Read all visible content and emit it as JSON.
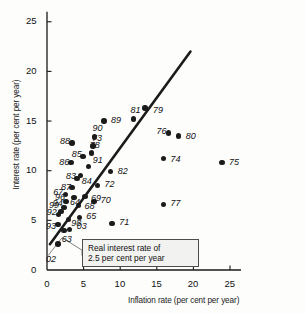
{
  "chart_data": {
    "type": "scatter",
    "title": "",
    "xlabel": "Inflation rate (per cent per year)",
    "ylabel": "Interest rate (per cent per year)",
    "xlim": [
      0,
      26.5
    ],
    "ylim": [
      0,
      26
    ],
    "xticks": [
      0,
      5,
      10,
      15,
      20,
      25
    ],
    "yticks": [
      0,
      5,
      10,
      15,
      20,
      25
    ],
    "grid": false,
    "legend": null,
    "annotations": [
      {
        "name": "real-interest-rate-note",
        "line1": "Real interest rate of",
        "line2": "2.5 per cent per year"
      }
    ],
    "trend_line": {
      "name": "real-interest-rate-line",
      "x0": 0.4,
      "y0": 2.6,
      "x1": 19.6,
      "y1": 22.0
    },
    "point_label_key": "year (two digits)",
    "points": [
      {
        "label": "02",
        "x": 1.5,
        "y": 2.6,
        "lx": -12,
        "ly": 16
      },
      {
        "label": "63",
        "x": 2.3,
        "y": 4.0,
        "lx": -2,
        "ly": 10
      },
      {
        "label": "03",
        "x": 3.1,
        "y": 4.1,
        "lx": 7,
        "ly": -2
      },
      {
        "label": "93",
        "x": 1.5,
        "y": 4.6,
        "lx": -12,
        "ly": 3
      },
      {
        "label": "98",
        "x": 2.9,
        "y": 5.1,
        "lx": 3,
        "ly": 5
      },
      {
        "label": "65",
        "x": 4.4,
        "y": 5.3,
        "lx": 7,
        "ly": 0
      },
      {
        "label": "92",
        "x": 1.6,
        "y": 5.6,
        "lx": -12,
        "ly": -1
      },
      {
        "label": "99",
        "x": 1.9,
        "y": 5.9,
        "lx": -12,
        "ly": -5
      },
      {
        "label": "94",
        "x": 2.3,
        "y": 6.3,
        "lx": -11,
        "ly": -3
      },
      {
        "label": "96",
        "x": 2.6,
        "y": 6.9,
        "lx": -11,
        "ly": -3
      },
      {
        "label": "68",
        "x": 4.3,
        "y": 6.5,
        "lx": 6,
        "ly": 2
      },
      {
        "label": "70",
        "x": 6.4,
        "y": 6.9,
        "lx": 7,
        "ly": 0
      },
      {
        "label": "77",
        "x": 15.9,
        "y": 6.6,
        "lx": 7,
        "ly": 0
      },
      {
        "label": "64",
        "x": 3.7,
        "y": 7.3,
        "lx": -4,
        "ly": 5
      },
      {
        "label": "67",
        "x": 2.5,
        "y": 7.6,
        "lx": -12,
        "ly": -2
      },
      {
        "label": "69",
        "x": 5.2,
        "y": 7.4,
        "lx": 6,
        "ly": 2
      },
      {
        "label": "87",
        "x": 3.4,
        "y": 8.3,
        "lx": -11,
        "ly": 0
      },
      {
        "label": "72",
        "x": 6.9,
        "y": 8.5,
        "lx": 7,
        "ly": -1
      },
      {
        "label": "83",
        "x": 4.1,
        "y": 9.2,
        "lx": -11,
        "ly": -2
      },
      {
        "label": "84",
        "x": 4.6,
        "y": 9.5,
        "lx": 1,
        "ly": 6
      },
      {
        "label": "71",
        "x": 8.9,
        "y": 4.7,
        "lx": 7,
        "ly": 0
      },
      {
        "label": "82",
        "x": 8.7,
        "y": 9.9,
        "lx": 7,
        "ly": 0
      },
      {
        "label": "91",
        "x": 5.7,
        "y": 10.4,
        "lx": 4,
        "ly": -6
      },
      {
        "label": "86",
        "x": 3.3,
        "y": 10.8,
        "lx": -12,
        "ly": 0
      },
      {
        "label": "75",
        "x": 23.9,
        "y": 10.8,
        "lx": 7,
        "ly": 0
      },
      {
        "label": "74",
        "x": 15.9,
        "y": 11.2,
        "lx": 7,
        "ly": 1
      },
      {
        "label": "85",
        "x": 4.9,
        "y": 11.4,
        "lx": -11,
        "ly": -2
      },
      {
        "label": "78",
        "x": 6.1,
        "y": 11.8,
        "lx": -2,
        "ly": -7
      },
      {
        "label": "73",
        "x": 6.3,
        "y": 12.5,
        "lx": -1,
        "ly": -7
      },
      {
        "label": "88",
        "x": 3.4,
        "y": 12.8,
        "lx": -12,
        "ly": -1
      },
      {
        "label": "90",
        "x": 6.5,
        "y": 13.4,
        "lx": -2,
        "ly": -8
      },
      {
        "label": "80",
        "x": 18.0,
        "y": 13.5,
        "lx": 7,
        "ly": 1
      },
      {
        "label": "76",
        "x": 16.6,
        "y": 13.8,
        "lx": -12,
        "ly": -1
      },
      {
        "label": "89",
        "x": 7.8,
        "y": 15.0,
        "lx": 7,
        "ly": 0
      },
      {
        "label": "81",
        "x": 11.8,
        "y": 15.2,
        "lx": -3,
        "ly": -8
      },
      {
        "label": "79",
        "x": 13.4,
        "y": 16.3,
        "lx": 8,
        "ly": 3
      }
    ]
  }
}
